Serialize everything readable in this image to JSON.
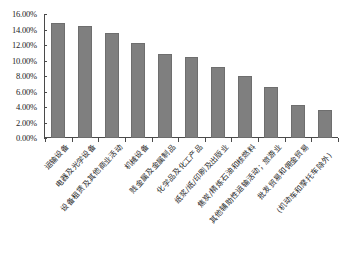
{
  "chart_data": {
    "type": "bar",
    "title": "",
    "subtitle": "",
    "xlabel": "",
    "ylabel": "",
    "ylim": [
      0,
      16
    ],
    "grid": false,
    "legend": "none",
    "y_unit": "percent",
    "y_ticks": [
      "0.00%",
      "2.00%",
      "4.00%",
      "6.00%",
      "8.00%",
      "10.00%",
      "12.00%",
      "14.00%",
      "16.00%"
    ],
    "y_tick_values": [
      0,
      2,
      4,
      6,
      8,
      10,
      12,
      14,
      16
    ],
    "categories": [
      "运输设备",
      "电器及光学设备",
      "设备租赁及其他商业活动",
      "机械设备",
      "贱金属及金属制品",
      "化学品及化工产品",
      "纸浆/纸/印刷及出版业",
      "焦炭/精炼石油和核燃料",
      "其他辅助性运输活动；旅游业",
      "批发贸易和佣金贸易",
      "(机动车和摩托车除外)"
    ],
    "series": [
      {
        "name": "占比",
        "values": [
          14.9,
          14.5,
          13.6,
          12.3,
          10.9,
          10.4,
          9.1,
          8.0,
          6.6,
          4.3,
          3.6
        ]
      }
    ],
    "value_labels": [
      "14.90%",
      "14.50%",
      "13.60%",
      "12.30%",
      "10.90%",
      "10.40%",
      "9.10%",
      "8.00%",
      "6.60%",
      "4.30%",
      "3.60%"
    ],
    "bar_color": "#7f7f7f",
    "axis_color": "#4a4a4a",
    "background_color": "#ffffff"
  },
  "caption": {
    "text": ""
  }
}
